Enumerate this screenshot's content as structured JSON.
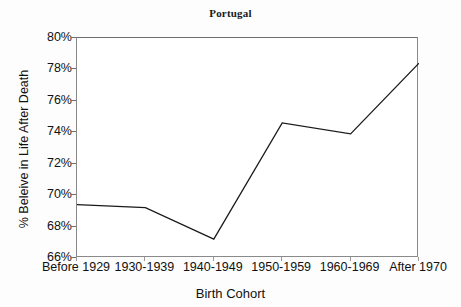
{
  "chart_data": {
    "type": "line",
    "title": "Portugal",
    "xlabel": "Birth Cohort",
    "ylabel": "% Beleive in Life After Death",
    "categories": [
      "Before 1929",
      "1930-1939",
      "1940-1949",
      "1950-1959",
      "1960-1969",
      "After 1970"
    ],
    "values": [
      69.4,
      69.2,
      67.2,
      74.6,
      73.9,
      78.4
    ],
    "series": [
      {
        "name": "Portugal",
        "values": [
          69.4,
          69.2,
          67.2,
          74.6,
          73.9,
          78.4
        ]
      }
    ],
    "ylim": [
      66,
      80
    ],
    "ytick_labels": [
      "66%",
      "68%",
      "70%",
      "72%",
      "74%",
      "76%",
      "78%",
      "80%"
    ],
    "ytick_values": [
      66,
      68,
      70,
      72,
      74,
      76,
      78,
      80
    ],
    "grid": false,
    "legend": "none",
    "line_color": "#1a1a1a"
  }
}
